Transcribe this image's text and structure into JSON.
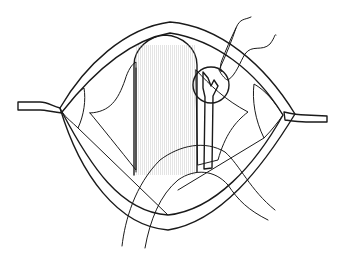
{
  "figure": {
    "type": "surgical-line-illustration",
    "colors": {
      "background": "#ffffff",
      "line": "#1a1a1a",
      "stipple_fill": "#dcdcdc",
      "dark_tissue": "#a8a8a8",
      "vessel": "#8c8c8c",
      "cylinder_light": "#f2f2f2",
      "cylinder_shade": "#9a9a9a"
    },
    "elements": [
      "left-retractor",
      "right-retractor",
      "wound-edge",
      "stippled-tissue",
      "central-cylinder",
      "branching-vessel",
      "highlight-circle",
      "suture-threads"
    ]
  }
}
